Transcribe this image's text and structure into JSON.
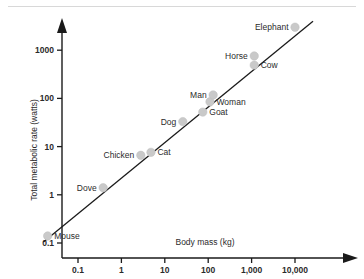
{
  "chart_data": {
    "type": "scatter",
    "title": "",
    "xlabel": "Body mass (kg)",
    "ylabel": "Total metabolic rate (watts)",
    "xscale": "log",
    "yscale": "log",
    "xlim": [
      0.015,
      40000
    ],
    "ylim": [
      0.085,
      4000
    ],
    "grid": false,
    "legend": "none",
    "xticks": [
      "0.1",
      "1",
      "10",
      "100",
      "1,000",
      "10,000"
    ],
    "xtick_values": [
      0.1,
      1,
      10,
      100,
      1000,
      10000
    ],
    "yticks": [
      "0.1",
      "1",
      "10",
      "100",
      "1000"
    ],
    "ytick_values": [
      0.1,
      1,
      10,
      100,
      1000
    ],
    "points": [
      {
        "label": "Mouse",
        "x": 0.02,
        "y": 0.14,
        "label_side": "right"
      },
      {
        "label": "Dove",
        "x": 0.38,
        "y": 1.4,
        "label_side": "left"
      },
      {
        "label": "Chicken",
        "x": 2.8,
        "y": 6.6,
        "label_side": "left"
      },
      {
        "label": "Cat",
        "x": 4.8,
        "y": 7.6,
        "label_side": "right"
      },
      {
        "label": "Dog",
        "x": 26,
        "y": 33,
        "label_side": "left"
      },
      {
        "label": "Goat",
        "x": 75,
        "y": 52,
        "label_side": "right"
      },
      {
        "label": "Woman",
        "x": 110,
        "y": 85,
        "label_side": "right"
      },
      {
        "label": "Man",
        "x": 130,
        "y": 118,
        "label_side": "left"
      },
      {
        "label": "Cow",
        "x": 1150,
        "y": 490,
        "label_side": "right"
      },
      {
        "label": "Horse",
        "x": 1150,
        "y": 760,
        "label_side": "left"
      },
      {
        "label": "Elephant",
        "x": 10000,
        "y": 3000,
        "label_side": "left"
      }
    ],
    "fit_line": {
      "description": "allometric scaling line",
      "x_start": 0.016,
      "y_start": 0.105,
      "x_end": 26000,
      "y_end": 4000
    },
    "annotations": {
      "axis_arrows": true,
      "axis_style": "arrow-headed L axes"
    }
  },
  "figure": {
    "x_axis_title": "Body mass (kg)",
    "y_axis_title": "Total metabolic rate (watts)"
  }
}
